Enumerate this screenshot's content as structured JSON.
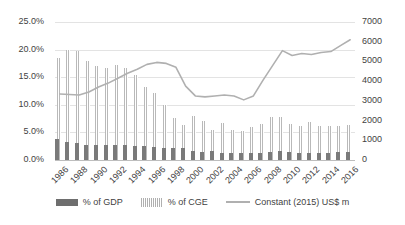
{
  "chart_data": {
    "type": "bar",
    "title": "",
    "xlabel": "",
    "ylabel": "",
    "grid": true,
    "legend_position": "bottom",
    "categories": [
      1986,
      1987,
      1988,
      1989,
      1990,
      1991,
      1992,
      1993,
      1994,
      1995,
      1996,
      1997,
      1998,
      1999,
      2000,
      2001,
      2002,
      2003,
      2004,
      2005,
      2006,
      2007,
      2008,
      2009,
      2010,
      2011,
      2012,
      2013,
      2014,
      2015,
      2016
    ],
    "x_tick_labels": [
      "1986",
      "1988",
      "1990",
      "1992",
      "1994",
      "1996",
      "1998",
      "2000",
      "2002",
      "2004",
      "2006",
      "2008",
      "2010",
      "2012",
      "2014",
      "2016"
    ],
    "axes": {
      "left": {
        "label": "",
        "ticks": [
          "0.0%",
          "5.0%",
          "10.0%",
          "15.0%",
          "20.0%",
          "25.0%"
        ],
        "tick_values": [
          0,
          5,
          10,
          15,
          20,
          25
        ],
        "min": 0,
        "max": 25,
        "unit": "%"
      },
      "right": {
        "label": "",
        "ticks": [
          "0",
          "1000",
          "2000",
          "3000",
          "4000",
          "5000",
          "6000",
          "7000"
        ],
        "tick_values": [
          0,
          1000,
          2000,
          3000,
          4000,
          5000,
          6000,
          7000
        ],
        "min": 0,
        "max": 7000,
        "unit": "US$ m"
      }
    },
    "series": [
      {
        "name": "% of GDP",
        "type": "bar",
        "axis": "left",
        "color": "#7a7a7a",
        "values": [
          3.8,
          3.3,
          3.0,
          2.8,
          2.7,
          2.7,
          2.7,
          2.7,
          2.6,
          2.6,
          2.4,
          2.2,
          2.2,
          2.1,
          1.6,
          1.5,
          1.6,
          1.3,
          1.2,
          1.2,
          1.2,
          1.3,
          1.5,
          1.6,
          1.5,
          1.3,
          1.3,
          1.3,
          1.3,
          1.4,
          1.4
        ]
      },
      {
        "name": "% of CGE",
        "type": "bar",
        "axis": "left",
        "color": "#b9b9b9",
        "values": [
          18.4,
          20.0,
          19.7,
          17.9,
          17.0,
          16.6,
          17.2,
          16.6,
          15.4,
          13.3,
          12.2,
          9.9,
          7.7,
          6.3,
          7.9,
          7.0,
          5.5,
          6.7,
          5.4,
          5.2,
          6.0,
          6.6,
          7.8,
          7.8,
          6.6,
          6.1,
          6.9,
          6.2,
          6.2,
          6.2,
          6.3
        ]
      },
      {
        "name": "Constant (2015) US$ m",
        "type": "line",
        "axis": "right",
        "color": "#b0b0b0",
        "values": [
          3350,
          3320,
          3300,
          3450,
          3700,
          3900,
          4150,
          4400,
          4600,
          4850,
          4950,
          4900,
          4700,
          3750,
          3250,
          3200,
          3250,
          3300,
          3250,
          3050,
          3250,
          4050,
          4800,
          5550,
          5300,
          5400,
          5350,
          5450,
          5500,
          5800,
          6100
        ]
      }
    ],
    "legend": [
      {
        "label": "% of GDP",
        "swatch": "solid-bar"
      },
      {
        "label": "% of CGE",
        "swatch": "hatched-bar"
      },
      {
        "label": "Constant (2015) US$ m",
        "swatch": "line"
      }
    ]
  }
}
